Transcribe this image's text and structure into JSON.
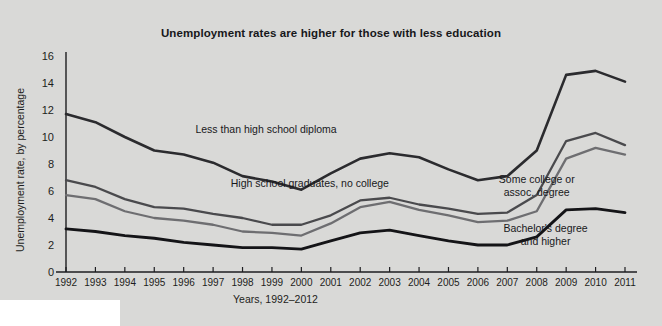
{
  "chart_data": {
    "type": "line",
    "title": "Unemployment rates are higher for those with less education",
    "xlabel": "Years, 1992–2012",
    "ylabel": "Unemployment rate, by percentage",
    "x": [
      1992,
      1993,
      1994,
      1995,
      1996,
      1997,
      1998,
      1999,
      2000,
      2001,
      2002,
      2003,
      2004,
      2005,
      2006,
      2007,
      2008,
      2009,
      2010,
      2011
    ],
    "xtick_labels": [
      "1992",
      "1993",
      "1994",
      "1995",
      "1996",
      "1997",
      "1998",
      "1999",
      "2000",
      "2001",
      "2002",
      "2003",
      "2004",
      "2005",
      "2006",
      "2007",
      "2008",
      "2009",
      "2010",
      "2011"
    ],
    "ytick_labels": [
      "0",
      "2",
      "4",
      "6",
      "8",
      "10",
      "12",
      "14",
      "16"
    ],
    "ytick_values": [
      0,
      2,
      4,
      6,
      8,
      10,
      12,
      14,
      16
    ],
    "ylim": [
      0,
      16
    ],
    "xlim": [
      1992,
      2011
    ],
    "grid": false,
    "legend_position": "inline-annotations",
    "series": [
      {
        "name": "Less than high school diploma",
        "color": "#2b2b2e",
        "label_x": 1996.4,
        "label_y": 10.3,
        "values": [
          11.7,
          11.1,
          10.0,
          9.0,
          8.7,
          8.1,
          7.1,
          6.7,
          6.1,
          7.3,
          8.4,
          8.8,
          8.5,
          7.6,
          6.8,
          7.1,
          9.0,
          14.6,
          14.9,
          14.1
        ]
      },
      {
        "name": "High school graduates, no college",
        "color": "#4a4a4d",
        "label_x": 1997.6,
        "label_y": 6.3,
        "values": [
          6.8,
          6.3,
          5.4,
          4.8,
          4.7,
          4.3,
          4.0,
          3.5,
          3.5,
          4.2,
          5.3,
          5.5,
          5.0,
          4.7,
          4.3,
          4.4,
          5.7,
          9.7,
          10.3,
          9.4
        ]
      },
      {
        "name": "Some college or assoc. degree",
        "color": "#6e6e71",
        "label_x": 2008.0,
        "label_y": 6.6,
        "values": [
          5.7,
          5.4,
          4.5,
          4.0,
          3.8,
          3.5,
          3.0,
          2.9,
          2.7,
          3.6,
          4.8,
          5.2,
          4.6,
          4.2,
          3.7,
          3.8,
          4.5,
          8.4,
          9.2,
          8.7
        ]
      },
      {
        "name": "Bachelor's degree and higher",
        "color": "#141417",
        "label_x": 2008.3,
        "label_y": 3.0,
        "values": [
          3.2,
          3.0,
          2.7,
          2.5,
          2.2,
          2.0,
          1.8,
          1.8,
          1.7,
          2.3,
          2.9,
          3.1,
          2.7,
          2.3,
          2.0,
          2.0,
          2.6,
          4.6,
          4.7,
          4.4
        ]
      }
    ]
  }
}
